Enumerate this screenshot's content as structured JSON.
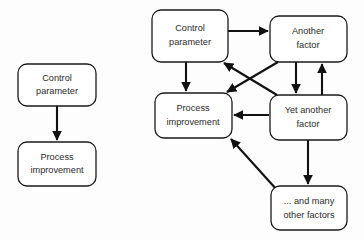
{
  "figure": {
    "background_color": "#fdfdfd",
    "stroke_color": "#111111",
    "box_fill": "#ffffff",
    "text_color": "#2b2b2b"
  },
  "left_diagram": {
    "name": "simple-one-way-model",
    "nodes": [
      {
        "id": "left-control-parameter",
        "line1": "Control",
        "line2": "parameter",
        "x": 18,
        "y": 64,
        "w": 78,
        "h": 42
      },
      {
        "id": "left-process-improvement",
        "line1": "Process",
        "line2": "improvement",
        "x": 18,
        "y": 142,
        "w": 78,
        "h": 44
      }
    ],
    "edges": [
      {
        "id": "left-control-to-process",
        "from": "left-control-parameter",
        "to": "left-process-improvement",
        "kind": "straight-down",
        "arrow": "single"
      }
    ]
  },
  "right_diagram": {
    "name": "multi-factor-interaction-model",
    "nodes": [
      {
        "id": "right-control-parameter",
        "line1": "Control",
        "line2": "parameter",
        "x": 152,
        "y": 10,
        "w": 76,
        "h": 52
      },
      {
        "id": "right-another-factor",
        "line1": "Another",
        "line2": "factor",
        "x": 270,
        "y": 16,
        "w": 77,
        "h": 46
      },
      {
        "id": "right-process-improvement",
        "line1": "Process",
        "line2": "improvement",
        "x": 155,
        "y": 93,
        "w": 77,
        "h": 45
      },
      {
        "id": "right-yet-another-factor",
        "line1": "Yet another",
        "line2": "factor",
        "x": 270,
        "y": 95,
        "w": 77,
        "h": 45
      },
      {
        "id": "right-many-other-factors",
        "line1": "... and many",
        "line2": "other factors",
        "x": 271,
        "y": 186,
        "w": 76,
        "h": 44
      }
    ],
    "edges": [
      {
        "id": "control-to-another",
        "from": "right-control-parameter",
        "to": "right-another-factor",
        "arrow": "single"
      },
      {
        "id": "control-to-process",
        "from": "right-control-parameter",
        "to": "right-process-improvement",
        "arrow": "single"
      },
      {
        "id": "another-to-process-diagonal",
        "from": "right-another-factor",
        "to": "right-process-improvement",
        "arrow": "single"
      },
      {
        "id": "yet-another-to-control-diagonal",
        "from": "right-yet-another-factor",
        "to": "right-control-parameter",
        "arrow": "single"
      },
      {
        "id": "another-to-yet-another",
        "from": "right-another-factor",
        "to": "right-yet-another-factor",
        "arrow": "single"
      },
      {
        "id": "yet-another-to-another",
        "from": "right-yet-another-factor",
        "to": "right-another-factor",
        "arrow": "single"
      },
      {
        "id": "yet-another-to-process",
        "from": "right-yet-another-factor",
        "to": "right-process-improvement",
        "arrow": "single"
      },
      {
        "id": "yet-another-to-many-others",
        "from": "right-yet-another-factor",
        "to": "right-many-other-factors",
        "arrow": "single"
      },
      {
        "id": "many-others-to-process-diagonal",
        "from": "right-many-other-factors",
        "to": "right-process-improvement",
        "arrow": "single"
      }
    ]
  }
}
